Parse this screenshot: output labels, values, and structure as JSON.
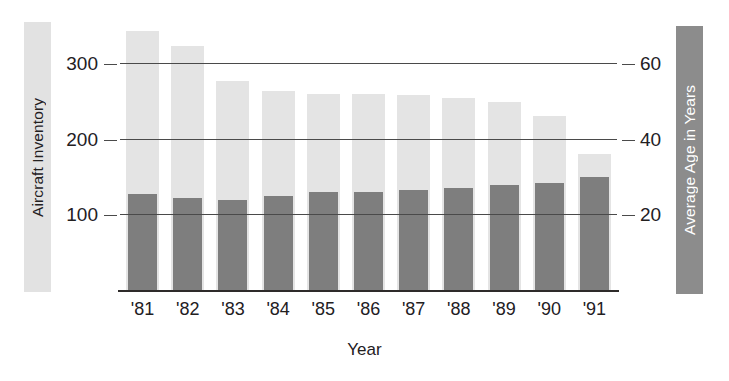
{
  "chart_data": {
    "type": "bar",
    "title": "",
    "subtitle": "",
    "xlabel": "Year",
    "categories": [
      "'81",
      "'82",
      "'83",
      "'84",
      "'85",
      "'86",
      "'87",
      "'88",
      "'89",
      "'90",
      "'91"
    ],
    "grid": true,
    "legend_position": "axis-titles",
    "series": [
      {
        "name": "Aircraft Inventory",
        "axis": "left",
        "color": "#e4e4e4",
        "values": [
          345,
          325,
          278,
          265,
          260,
          260,
          259,
          256,
          250,
          231,
          181
        ]
      },
      {
        "name": "Average Age in Years",
        "axis": "right",
        "color": "#7e7e7e",
        "values": [
          25.5,
          24.5,
          24,
          25,
          26,
          26,
          26.5,
          27,
          28,
          28.5,
          30
        ]
      }
    ],
    "left_axis": {
      "label": "Aircraft Inventory",
      "ticks": [
        "100",
        "200",
        "300"
      ],
      "tick_values": [
        100,
        200,
        300
      ],
      "ylim": [
        0,
        375
      ]
    },
    "right_axis": {
      "label": "Average Age in Years",
      "ticks": [
        "20",
        "40",
        "60"
      ],
      "tick_values": [
        20,
        40,
        60
      ],
      "ylim": [
        0,
        75
      ]
    }
  },
  "colors": {
    "light_bar": "#e4e4e4",
    "dark_bar": "#7e7e7e",
    "axis": "#2e2b2a",
    "gridline": "#4a4a4a",
    "text": "#23201f",
    "legend_right_text": "#ffffff",
    "background": "#ffffff"
  }
}
